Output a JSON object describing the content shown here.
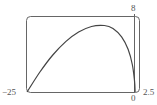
{
  "chart_data": {
    "type": "line",
    "title": "",
    "xlabel": "",
    "ylabel": "",
    "xlim": [
      -25,
      2.5
    ],
    "ylim": [
      0,
      8
    ],
    "grid": false,
    "legend": null,
    "tick_labels": {
      "x_min": "−25",
      "x_origin": "0",
      "x_max": "2.5",
      "y_max": "8"
    },
    "series": [
      {
        "name": "curve",
        "x": [
          -25,
          -22,
          -19,
          -16,
          -13,
          -10,
          -7,
          -5,
          -3,
          -1.5,
          -0.5,
          0,
          0.3
        ],
        "y": [
          0,
          2.1,
          3.9,
          5.3,
          6.3,
          6.9,
          7.0,
          6.7,
          5.8,
          4.5,
          2.9,
          1.2,
          0
        ]
      }
    ]
  },
  "colors": {
    "curve": "#444444",
    "frame": "#555555",
    "axis": "#555555",
    "text": "#555555"
  }
}
